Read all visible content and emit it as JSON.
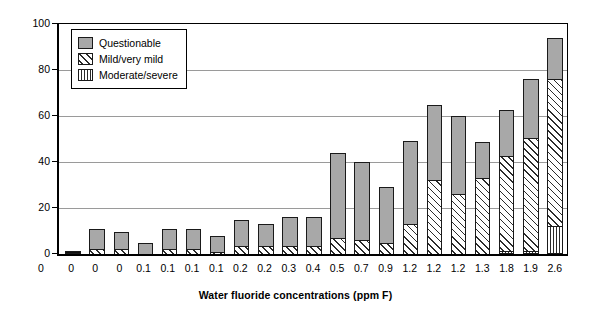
{
  "chart_data": {
    "type": "bar",
    "subtype": "stacked-bar",
    "title": "",
    "xlabel": "Water fluoride concentrations (ppm F)",
    "ylabel": "Percent",
    "ylim": [
      0,
      100
    ],
    "yticks": [
      0,
      20,
      40,
      60,
      80,
      100
    ],
    "grid": true,
    "legend_position": "upper-left",
    "categories": [
      "0",
      "0",
      "0",
      "0.1",
      "0.1",
      "0.1",
      "0.1",
      "0.2",
      "0.2",
      "0.3",
      "0.4",
      "0.5",
      "0.7",
      "0.9",
      "1.2",
      "1.2",
      "1.2",
      "1.3",
      "1.8",
      "1.9",
      "2.6"
    ],
    "series": [
      {
        "name": "Moderate/severe",
        "values": [
          0,
          0,
          0,
          0,
          0,
          0,
          0,
          0,
          0,
          0,
          0,
          0,
          0,
          0,
          0,
          0,
          0,
          0,
          1.5,
          1.5,
          12
        ]
      },
      {
        "name": "Mild/very mild",
        "values": [
          1,
          2,
          2,
          0,
          2,
          2,
          1,
          3.5,
          3.5,
          3.5,
          3.5,
          7,
          6,
          5,
          13,
          32,
          26,
          33,
          41,
          49,
          64
        ]
      },
      {
        "name": "Questionable",
        "values": [
          0,
          9,
          7.5,
          5,
          9,
          9,
          7,
          11.5,
          9.5,
          12.5,
          12.5,
          37,
          34,
          24,
          36,
          33,
          34,
          15.5,
          20,
          25.5,
          18
        ]
      }
    ],
    "totals": [
      1,
      11,
      9.5,
      5,
      11,
      11,
      8,
      15,
      13,
      16,
      16,
      44,
      40,
      29,
      49,
      65,
      60,
      48.5,
      61,
      73,
      94
    ],
    "x_axis_origin_label": "0"
  },
  "legend": {
    "items": [
      {
        "label": "Questionable",
        "pattern": "solid-gray",
        "color": "#a8a8a8"
      },
      {
        "label": "Mild/very mild",
        "pattern": "diagonal-hatch",
        "color": "#2b2b2b"
      },
      {
        "label": "Moderate/severe",
        "pattern": "vertical-hatch",
        "color": "#2b2b2b"
      }
    ]
  }
}
